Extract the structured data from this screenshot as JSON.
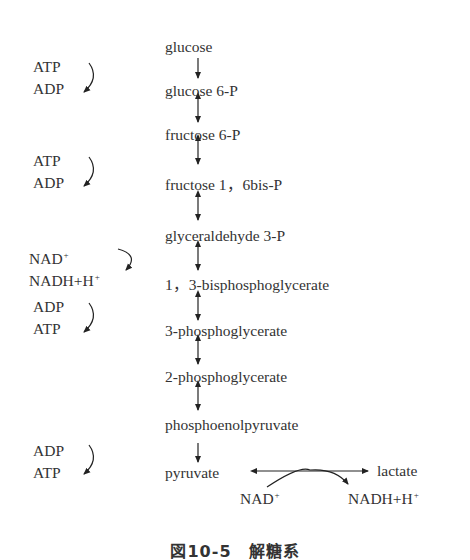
{
  "figure": {
    "caption": "図10-5　解糖系",
    "title": "解糖系"
  },
  "pathway": {
    "compounds": [
      {
        "label": "glucose"
      },
      {
        "label": "glucose 6-P"
      },
      {
        "label": "fructose 6-P"
      },
      {
        "label": "fructose 1，6bis-P"
      },
      {
        "label": "glyceraldehyde 3-P"
      },
      {
        "label": "1，3-bisphosphoglycerate"
      },
      {
        "label": "3-phosphoglycerate"
      },
      {
        "label": "2-phosphoglycerate"
      },
      {
        "label": "phosphoenolpyruvate"
      },
      {
        "label": "pyruvate"
      }
    ],
    "arrows": [
      "irreversible",
      "reversible",
      "reversible",
      "reversible",
      "reversible",
      "reversible",
      "reversible",
      "reversible",
      "irreversible"
    ],
    "cofactors": [
      {
        "in": "ATP",
        "out": "ADP",
        "step": "glucose → glucose 6-P"
      },
      {
        "in": "ATP",
        "out": "ADP",
        "step": "fructose 6-P → fructose 1,6bis-P"
      },
      {
        "in": "NAD",
        "in_sup": "+",
        "out": "NADH+H",
        "out_sup": "+",
        "step": "glyceraldehyde 3-P → 1,3-bisphosphoglycerate"
      },
      {
        "in": "ADP",
        "out": "ATP",
        "step": "1,3-bisphosphoglycerate → 3-phosphoglycerate"
      },
      {
        "in": "ADP",
        "out": "ATP",
        "step": "phosphoenolpyruvate → pyruvate"
      }
    ],
    "lactate_branch": {
      "product": "lactate",
      "cofactor_in": "NAD",
      "cofactor_in_sup": "+",
      "cofactor_out": "NADH+H",
      "cofactor_out_sup": "+"
    }
  }
}
